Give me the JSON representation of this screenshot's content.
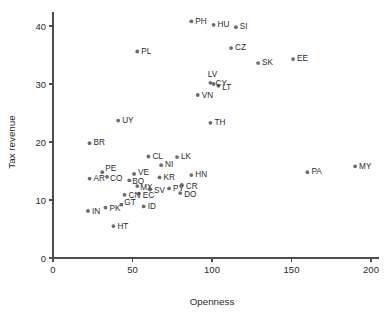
{
  "chart_data": {
    "type": "scatter",
    "title": "",
    "xlabel": "Openness",
    "ylabel": "Tax revenue",
    "xlim": [
      0,
      205
    ],
    "ylim": [
      0,
      42.5
    ],
    "xticks": [
      0,
      50,
      100,
      150,
      200
    ],
    "yticks": [
      0,
      10,
      20,
      30,
      40
    ],
    "xticklabels": [
      "0",
      "50",
      "100",
      "150",
      "200"
    ],
    "yticklabels": [
      "0",
      "10",
      "20",
      "30",
      "40"
    ],
    "grid": false,
    "legend": false,
    "marker": "filled-circle",
    "marker_color": "#6b6b70",
    "points": [
      {
        "label": "PH",
        "x": 87,
        "y": 40.8,
        "lx": 4,
        "ly": 0,
        "anchor": "start"
      },
      {
        "label": "HU",
        "x": 101,
        "y": 40.2,
        "lx": 4,
        "ly": 0,
        "anchor": "start"
      },
      {
        "label": "SI",
        "x": 115,
        "y": 39.8,
        "lx": 4,
        "ly": 0,
        "anchor": "start"
      },
      {
        "label": "CZ",
        "x": 112,
        "y": 36.2,
        "lx": 4,
        "ly": 0,
        "anchor": "start"
      },
      {
        "label": "PL",
        "x": 53,
        "y": 35.6,
        "lx": 4,
        "ly": 0,
        "anchor": "start"
      },
      {
        "label": "SK",
        "x": 129,
        "y": 33.6,
        "lx": 4,
        "ly": 0,
        "anchor": "start"
      },
      {
        "label": "EE",
        "x": 151,
        "y": 34.3,
        "lx": 4,
        "ly": 0,
        "anchor": "start"
      },
      {
        "label": "LV",
        "x": 99,
        "y": 30.2,
        "lx": 2,
        "ly": -8,
        "anchor": "middle"
      },
      {
        "label": "CY",
        "x": 101,
        "y": 30.0,
        "lx": 2,
        "ly": 0,
        "anchor": "start"
      },
      {
        "label": "LT",
        "x": 104,
        "y": 29.7,
        "lx": 4,
        "ly": 2,
        "anchor": "start"
      },
      {
        "label": "VN",
        "x": 91,
        "y": 28.1,
        "lx": 4,
        "ly": 1,
        "anchor": "start"
      },
      {
        "label": "TH",
        "x": 99,
        "y": 23.3,
        "lx": 4,
        "ly": 0,
        "anchor": "start"
      },
      {
        "label": "UY",
        "x": 41,
        "y": 23.7,
        "lx": 4,
        "ly": 0,
        "anchor": "start"
      },
      {
        "label": "BR",
        "x": 23,
        "y": 19.8,
        "lx": 4,
        "ly": 0,
        "anchor": "start"
      },
      {
        "label": "CL",
        "x": 60,
        "y": 17.5,
        "lx": 4,
        "ly": 0,
        "anchor": "start"
      },
      {
        "label": "LK",
        "x": 78,
        "y": 17.4,
        "lx": 4,
        "ly": 0,
        "anchor": "start"
      },
      {
        "label": "NI",
        "x": 68,
        "y": 16.0,
        "lx": 4,
        "ly": 0,
        "anchor": "start"
      },
      {
        "label": "MY",
        "x": 190,
        "y": 15.8,
        "lx": 4,
        "ly": 0,
        "anchor": "start"
      },
      {
        "label": "PE",
        "x": 31,
        "y": 14.8,
        "lx": 3,
        "ly": -3,
        "anchor": "start"
      },
      {
        "label": "PA",
        "x": 160,
        "y": 14.8,
        "lx": 4,
        "ly": 0,
        "anchor": "start"
      },
      {
        "label": "VE",
        "x": 51,
        "y": 14.5,
        "lx": 4,
        "ly": -1,
        "anchor": "start"
      },
      {
        "label": "HN",
        "x": 87,
        "y": 14.3,
        "lx": 4,
        "ly": 0,
        "anchor": "start"
      },
      {
        "label": "CO",
        "x": 34,
        "y": 14.0,
        "lx": 3,
        "ly": 2,
        "anchor": "start"
      },
      {
        "label": "KR",
        "x": 67,
        "y": 13.9,
        "lx": 4,
        "ly": 0,
        "anchor": "start"
      },
      {
        "label": "AR",
        "x": 23,
        "y": 13.7,
        "lx": 4,
        "ly": 0,
        "anchor": "start"
      },
      {
        "label": "BO",
        "x": 48,
        "y": 13.4,
        "lx": 3,
        "ly": 2,
        "anchor": "start"
      },
      {
        "label": "CR",
        "x": 81,
        "y": 12.6,
        "lx": 4,
        "ly": 2,
        "anchor": "start"
      },
      {
        "label": "MX",
        "x": 53,
        "y": 12.4,
        "lx": 3,
        "ly": 2,
        "anchor": "start"
      },
      {
        "label": "PY",
        "x": 73,
        "y": 12.0,
        "lx": 4,
        "ly": 0,
        "anchor": "start"
      },
      {
        "label": "SV",
        "x": 61,
        "y": 11.8,
        "lx": 4,
        "ly": 1,
        "anchor": "start"
      },
      {
        "label": "DO",
        "x": 80,
        "y": 11.2,
        "lx": 4,
        "ly": 2,
        "anchor": "start"
      },
      {
        "label": "EC",
        "x": 54,
        "y": 11.1,
        "lx": 4,
        "ly": 2,
        "anchor": "start"
      },
      {
        "label": "CN",
        "x": 45,
        "y": 10.9,
        "lx": 4,
        "ly": 1,
        "anchor": "start"
      },
      {
        "label": "GT",
        "x": 43,
        "y": 9.2,
        "lx": 3,
        "ly": -2,
        "anchor": "start"
      },
      {
        "label": "ID",
        "x": 57,
        "y": 8.9,
        "lx": 4,
        "ly": 0,
        "anchor": "start"
      },
      {
        "label": "PK",
        "x": 33,
        "y": 8.7,
        "lx": 4,
        "ly": 1,
        "anchor": "start"
      },
      {
        "label": "IN",
        "x": 22,
        "y": 8.1,
        "lx": 4,
        "ly": 1,
        "anchor": "start"
      },
      {
        "label": "HT",
        "x": 38,
        "y": 5.5,
        "lx": 4,
        "ly": 1,
        "anchor": "start"
      }
    ]
  }
}
